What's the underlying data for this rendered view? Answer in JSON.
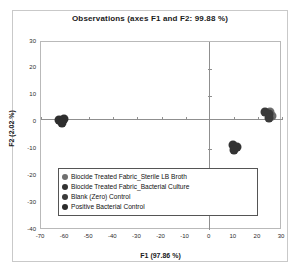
{
  "chart_data": {
    "type": "scatter",
    "title": "Observations (axes F1 and F2: 99.88 %)",
    "xlabel": "F1 (97.86 %)",
    "ylabel": "F2 (2.02 %)",
    "xlim": [
      -70,
      30
    ],
    "ylim": [
      -40,
      30
    ],
    "xticks": [
      -70,
      -60,
      -50,
      -40,
      -30,
      -20,
      -10,
      0,
      10,
      20,
      30
    ],
    "yticks": [
      30,
      20,
      10,
      0,
      -10,
      -20,
      -30,
      -40
    ],
    "grid": false,
    "legend_position": "inside-bottom-center",
    "axis_lines": {
      "x_zero": true,
      "y_zero": true
    },
    "series": [
      {
        "name": "Biocide Treated Fabric_Sterile LB Broth",
        "color": "#6b6b6b",
        "points": [
          {
            "x": 26.0,
            "y": 2.3
          },
          {
            "x": 25.2,
            "y": 4.0
          }
        ]
      },
      {
        "name": "Biocide Treated Fabric_Bacterial Culture",
        "color": "#3a3a3a",
        "points": [
          {
            "x": 22.8,
            "y": 3.9
          },
          {
            "x": 24.4,
            "y": 3.2
          },
          {
            "x": 24.8,
            "y": 1.6
          }
        ]
      },
      {
        "name": "Blank (Zero) Control",
        "color": "#2e2e2e",
        "points": [
          {
            "x": -62.5,
            "y": 0.9
          },
          {
            "x": -60.6,
            "y": 1.2
          },
          {
            "x": -61.3,
            "y": -0.3
          }
        ]
      },
      {
        "name": "Positive Bacterial Control",
        "color": "#333333",
        "points": [
          {
            "x": 9.6,
            "y": -8.3
          },
          {
            "x": 11.3,
            "y": -9.0
          },
          {
            "x": 10.2,
            "y": -10.2
          }
        ]
      }
    ]
  },
  "legend": {
    "items": [
      {
        "label": "Biocide Treated Fabric_Sterile LB Broth",
        "color": "#6f6f6f"
      },
      {
        "label": "Biocide Treated Fabric_Bacterial Culture",
        "color": "#333333"
      },
      {
        "label": "Blank (Zero) Control",
        "color": "#3a3a3a"
      },
      {
        "label": "Positive Bacterial Control",
        "color": "#2b2b2b"
      }
    ]
  }
}
